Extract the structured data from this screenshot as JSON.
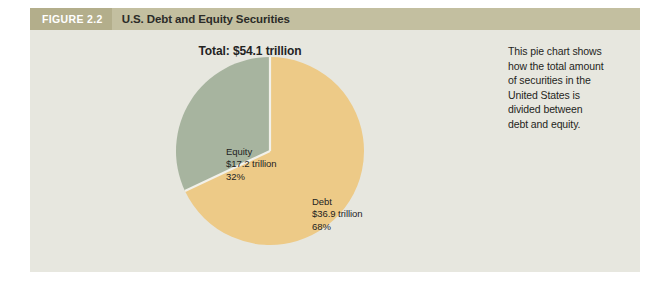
{
  "figure": {
    "number_label": "FIGURE 2.2",
    "title": "U.S. Debt and Equity Securities"
  },
  "chart_data": {
    "type": "pie",
    "title": "Total: $54.1 trillion",
    "total_value": 54.1,
    "total_units": "trillion",
    "currency": "USD",
    "start_angle_deg": 0,
    "direction": "clockwise",
    "legend": "none-inline-labels",
    "categories": [
      "Debt",
      "Equity"
    ],
    "values": [
      36.9,
      17.2
    ],
    "percentages": [
      68,
      32
    ],
    "colors": [
      "#edca87",
      "#a7b49f"
    ],
    "slices": [
      {
        "name": "Debt",
        "value_label": "$36.9 trillion",
        "percent_label": "68%",
        "value": 36.9,
        "percent": 68,
        "color": "#edca87"
      },
      {
        "name": "Equity",
        "value_label": "$17.2 trillion",
        "percent_label": "32%",
        "value": 17.2,
        "percent": 32,
        "color": "#a7b49f"
      }
    ]
  },
  "caption": {
    "lines": [
      "This pie chart shows",
      "how the total amount",
      "of securities in the",
      "United States is",
      "divided between",
      "debt and equity."
    ]
  },
  "theme": {
    "panel_background": "#e7e7df",
    "header_bar": "#c3bfa0",
    "header_number_block": "#b3ae8b",
    "page_background": "#ffffff",
    "text_dark": "#23231f",
    "text_on_header": "#ffffff",
    "slice_divider": "#f2f1ea"
  }
}
